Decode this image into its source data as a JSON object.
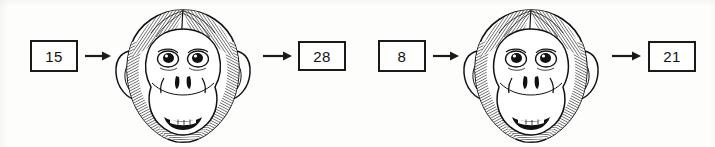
{
  "page": {
    "background_color": "#fdfdfc",
    "ink_color": "#1a1a1a",
    "width": 715,
    "height": 147
  },
  "machines": [
    {
      "id": "machine-1",
      "input": {
        "value": "15",
        "label": "input-value"
      },
      "operator": {
        "icon": "monkey-head-icon",
        "label": "monkey function machine"
      },
      "output": {
        "value": "28",
        "label": "output-value"
      },
      "arrows": [
        {
          "name": "arrow-input-to-machine",
          "direction": "right"
        },
        {
          "name": "arrow-machine-to-output",
          "direction": "right"
        }
      ]
    },
    {
      "id": "machine-2",
      "input": {
        "value": "8",
        "label": "input-value"
      },
      "operator": {
        "icon": "monkey-head-icon",
        "label": "monkey function machine"
      },
      "output": {
        "value": "21",
        "label": "output-value"
      },
      "arrows": [
        {
          "name": "arrow-input-to-machine",
          "direction": "right"
        },
        {
          "name": "arrow-machine-to-output",
          "direction": "right"
        }
      ]
    }
  ]
}
